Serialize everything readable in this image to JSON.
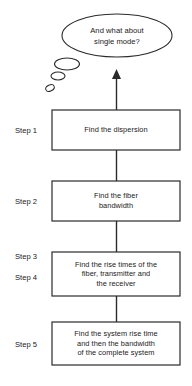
{
  "diagram": {
    "background_color": "#ffffff",
    "line_color": "#2b2b2b",
    "text_color": "#1a1a1a",
    "thought_bubble": {
      "text": "And what about\nsingle mode?",
      "line1": "And what about",
      "line2": "single mode?",
      "tail_bubbles": 3
    },
    "arrow": {
      "direction": "up",
      "name": "upward-arrow"
    },
    "steps": [
      {
        "label": "Step 1",
        "labels": [
          "Step 1"
        ],
        "text": "Find the dispersion",
        "lines": [
          "Find the dispersion"
        ]
      },
      {
        "label": "Step 2",
        "labels": [
          "Step 2"
        ],
        "text": "Find the fiber\nbandwidth",
        "lines": [
          "Find the fiber",
          "bandwidth"
        ]
      },
      {
        "label": "Step 3 / Step 4",
        "labels": [
          "Step 3",
          "Step 4"
        ],
        "text": "Find the rise times of the\nfiber, transmitter and\nthe receiver",
        "lines": [
          "Find the rise times of the",
          "fiber, transmitter and",
          "the receiver"
        ]
      },
      {
        "label": "Step 5",
        "labels": [
          "Step 5"
        ],
        "text": "Find the system rise time\nand then the bandwidth\nof the complete system",
        "lines": [
          "Find the system rise time",
          "and then the bandwidth",
          "of the complete system"
        ]
      }
    ]
  }
}
